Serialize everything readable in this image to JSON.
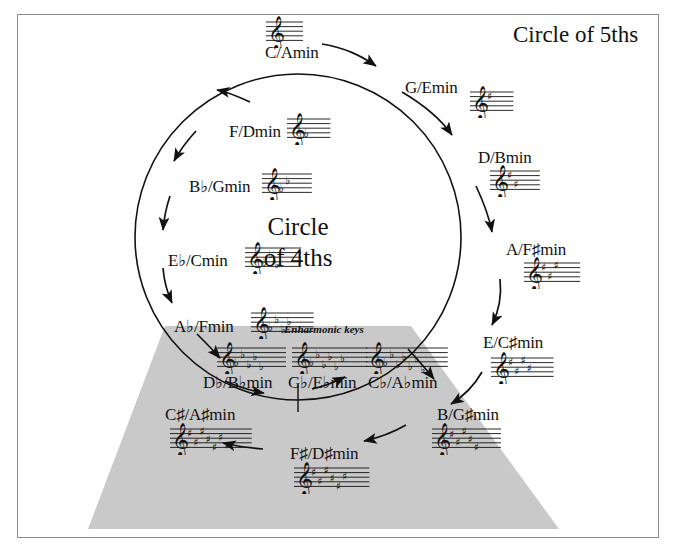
{
  "figure": {
    "title": "Circle of 5ths",
    "center_line1": "Circle",
    "center_line2": "of 4ths",
    "enharmonic_label": "Enharmonic keys",
    "background_color": "#ffffff",
    "trapezoid_color": "#c9c9c9",
    "frame_color": "#8c8c8c",
    "ink_color": "#111111"
  },
  "chart_data": {
    "type": "diagram",
    "title": "Circle of 5ths",
    "inner_title": "Circle of 4ths",
    "keys": [
      {
        "id": "c",
        "label": "C/Amin",
        "major": "C",
        "minor": "Amin",
        "accidental_count": 0,
        "accidental_type": "none",
        "angle_deg": 0,
        "x": 265,
        "y": 44,
        "staff_x": 264,
        "staff_y": 14,
        "arrow_side": "top"
      },
      {
        "id": "g",
        "label": "G/Emin",
        "major": "G",
        "minor": "Emin",
        "accidental_count": 1,
        "accidental_type": "sharp",
        "angle_deg": 30,
        "x": 405,
        "y": 79,
        "staff_x": 468,
        "staff_y": 84,
        "arrow_side": "right"
      },
      {
        "id": "d",
        "label": "D/Bmin",
        "major": "D",
        "minor": "Bmin",
        "accidental_count": 2,
        "accidental_type": "sharp",
        "angle_deg": 60,
        "x": 478,
        "y": 149,
        "staff_x": 488,
        "staff_y": 163,
        "arrow_side": "right"
      },
      {
        "id": "a",
        "label": "A/F♯min",
        "major": "A",
        "minor": "F♯min",
        "accidental_count": 3,
        "accidental_type": "sharp",
        "angle_deg": 90,
        "x": 506,
        "y": 241,
        "staff_x": 522,
        "staff_y": 255,
        "arrow_side": "right"
      },
      {
        "id": "e",
        "label": "E/C♯min",
        "major": "E",
        "minor": "C♯min",
        "accidental_count": 4,
        "accidental_type": "sharp",
        "angle_deg": 120,
        "x": 483,
        "y": 334,
        "staff_x": 489,
        "staff_y": 350,
        "arrow_side": "right"
      },
      {
        "id": "b",
        "label": "B/G♯min",
        "major": "B",
        "minor": "G♯min",
        "accidental_count": 5,
        "accidental_type": "sharp",
        "angle_deg": 150,
        "x": 437,
        "y": 406,
        "staff_x": 430,
        "staff_y": 421,
        "arrow_side": "bottom"
      },
      {
        "id": "fs",
        "label": "F♯/D♯min",
        "major": "F♯",
        "minor": "D♯min",
        "accidental_count": 6,
        "accidental_type": "sharp",
        "angle_deg": 180,
        "x": 290,
        "y": 445,
        "staff_x": 292,
        "staff_y": 460,
        "arrow_side": "bottom"
      },
      {
        "id": "cs",
        "label": "C♯/A♯min",
        "major": "C♯",
        "minor": "A♯min",
        "accidental_count": 7,
        "accidental_type": "sharp",
        "angle_deg": 210,
        "x": 165,
        "y": 406,
        "staff_x": 168,
        "staff_y": 421,
        "arrow_side": "bottom"
      },
      {
        "id": "cb",
        "label": "C♭/A♭min",
        "major": "C♭",
        "minor": "A♭min",
        "accidental_count": 7,
        "accidental_type": "flat",
        "angle_deg": 150,
        "x": 368,
        "y": 374,
        "staff_x": 364,
        "staff_y": 340,
        "arrow_side": "bottom"
      },
      {
        "id": "gb",
        "label": "G♭/E♭min",
        "major": "G♭",
        "minor": "E♭min",
        "accidental_count": 6,
        "accidental_type": "flat",
        "angle_deg": 180,
        "x": 288,
        "y": 374,
        "staff_x": 290,
        "staff_y": 340,
        "arrow_side": "bottom"
      },
      {
        "id": "db",
        "label": "D♭/B♭min",
        "major": "D♭",
        "minor": "B♭min",
        "accidental_count": 5,
        "accidental_type": "flat",
        "angle_deg": 210,
        "x": 203,
        "y": 374,
        "staff_x": 215,
        "staff_y": 340,
        "arrow_side": "bottom"
      },
      {
        "id": "ab",
        "label": "A♭/Fmin",
        "major": "A♭",
        "minor": "Fmin",
        "accidental_count": 4,
        "accidental_type": "flat",
        "angle_deg": 240,
        "x": 174,
        "y": 318,
        "staff_x": 249,
        "staff_y": 305,
        "arrow_side": "left"
      },
      {
        "id": "eb",
        "label": "E♭/Cmin",
        "major": "E♭",
        "minor": "Cmin",
        "accidental_count": 3,
        "accidental_type": "flat",
        "angle_deg": 270,
        "x": 168,
        "y": 252,
        "staff_x": 243,
        "staff_y": 240,
        "arrow_side": "left"
      },
      {
        "id": "bb",
        "label": "B♭/Gmin",
        "major": "B♭",
        "minor": "Gmin",
        "accidental_count": 2,
        "accidental_type": "flat",
        "angle_deg": 300,
        "x": 189,
        "y": 178,
        "staff_x": 260,
        "staff_y": 166,
        "arrow_side": "left"
      },
      {
        "id": "f",
        "label": "F/Dmin",
        "major": "F",
        "minor": "Dmin",
        "accidental_count": 1,
        "accidental_type": "flat",
        "angle_deg": 330,
        "x": 229,
        "y": 123,
        "staff_x": 285,
        "staff_y": 111,
        "arrow_side": "left"
      }
    ]
  }
}
